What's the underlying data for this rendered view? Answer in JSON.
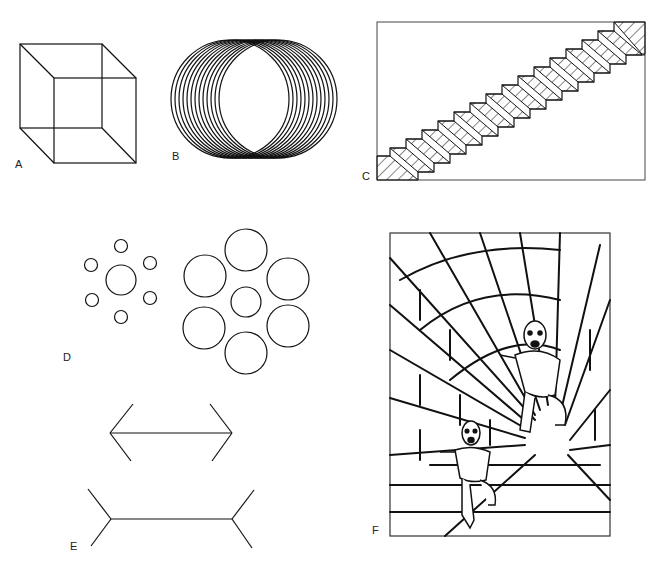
{
  "figure": {
    "panels": [
      {
        "id": "A",
        "label": "A",
        "description": "Necker cube"
      },
      {
        "id": "B",
        "label": "B",
        "description": "Overlapping circles (ambiguous cylinder)"
      },
      {
        "id": "C",
        "label": "C",
        "description": "Schroeder staircase"
      },
      {
        "id": "D",
        "label": "D",
        "description": "Ebbinghaus illusion"
      },
      {
        "id": "E",
        "label": "E",
        "description": "Müller-Lyer illusion"
      },
      {
        "id": "F",
        "label": "F",
        "description": "Ponzo/corridor size illusion"
      }
    ]
  }
}
